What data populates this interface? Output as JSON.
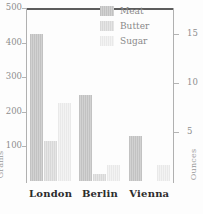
{
  "chart_data": {
    "type": "bar",
    "title": "",
    "xlabel": "",
    "ylabel": "Grams",
    "y2label": "Ounces",
    "categories": [
      "London",
      "Berlin",
      "Vienna"
    ],
    "series": [
      {
        "name": "Meat",
        "values": [
          425,
          250,
          130
        ],
        "color": "#c9c9c9"
      },
      {
        "name": "Butter",
        "values": [
          115,
          20,
          0
        ],
        "color": "#dedede"
      },
      {
        "name": "Sugar",
        "values": [
          225,
          45,
          45
        ],
        "color": "#eeeeee"
      }
    ],
    "ylim": [
      0,
      500
    ],
    "yticks": [
      100,
      200,
      300,
      400,
      500
    ],
    "ytick_labels": [
      "100",
      "200",
      "300",
      "400",
      "500"
    ],
    "y2lim": [
      0,
      17.637
    ],
    "y2ticks": [
      5,
      10,
      15
    ],
    "y2tick_labels": [
      "5",
      "10",
      "15"
    ],
    "grid": false,
    "legend_position": "top-right"
  },
  "legend": {
    "items": [
      {
        "label": "Meat"
      },
      {
        "label": "Butter"
      },
      {
        "label": "Sugar"
      }
    ]
  },
  "axes": {
    "left_title": "Grams",
    "right_title": "Ounces",
    "left_ticks": [
      {
        "label": "500"
      },
      {
        "label": "400"
      },
      {
        "label": "300"
      },
      {
        "label": "200"
      },
      {
        "label": "100"
      }
    ],
    "right_ticks": [
      {
        "label": "15"
      },
      {
        "label": "10"
      },
      {
        "label": "5"
      }
    ]
  },
  "xaxis": {
    "labels": [
      {
        "text": "London"
      },
      {
        "text": "Berlin"
      },
      {
        "text": "Vienna"
      }
    ]
  }
}
